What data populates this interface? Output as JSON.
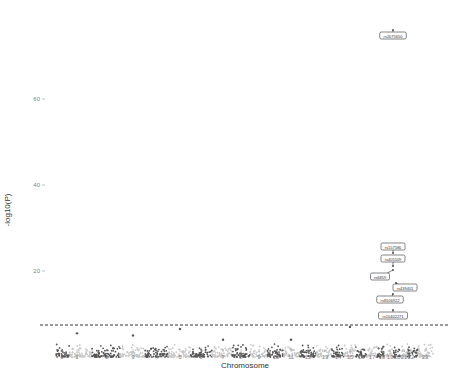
{
  "chart_data": {
    "type": "scatter",
    "subtype": "manhattan",
    "title": "",
    "xlabel": "Chromosome",
    "ylabel": "-log10(P)",
    "ylim": [
      0,
      80
    ],
    "yticks": [
      20,
      40,
      60
    ],
    "grid": false,
    "legend": null,
    "significance_threshold": 7.3,
    "threshold_style": "dashed",
    "point_color": "#555555",
    "chromosomes": [
      {
        "label": "0",
        "x": 62
      },
      {
        "label": "1",
        "x": 77
      },
      {
        "label": "2",
        "x": 107
      },
      {
        "label": "3",
        "x": 133
      },
      {
        "label": "4",
        "x": 157
      },
      {
        "label": "5",
        "x": 180
      },
      {
        "label": "6",
        "x": 201
      },
      {
        "label": "7",
        "x": 223
      },
      {
        "label": "8",
        "x": 241
      },
      {
        "label": "9",
        "x": 259
      },
      {
        "label": "10",
        "x": 276
      },
      {
        "label": "11",
        "x": 291
      },
      {
        "label": "12",
        "x": 308
      },
      {
        "label": "13",
        "x": 325
      },
      {
        "label": "14",
        "x": 338
      },
      {
        "label": "15",
        "x": 350
      },
      {
        "label": "16",
        "x": 361
      },
      {
        "label": "17",
        "x": 372
      },
      {
        "label": "18",
        "x": 382
      },
      {
        "label": "19",
        "x": 390
      },
      {
        "label": "20",
        "x": 397
      },
      {
        "label": "21",
        "x": 404
      },
      {
        "label": "22",
        "x": 411
      },
      {
        "label": "23",
        "x": 425
      }
    ],
    "annotated_snps": [
      {
        "id": "rs2075650",
        "chromosome": "19",
        "neglog10p": 76
      },
      {
        "id": "rs157580",
        "chromosome": "19",
        "neglog10p": 24
      },
      {
        "id": "rs405509",
        "chromosome": "19",
        "neglog10p": 22
      },
      {
        "id": "rs6859",
        "chromosome": "19",
        "neglog10p": 19
      },
      {
        "id": "rs439401",
        "chromosome": "19",
        "neglog10p": 17
      },
      {
        "id": "rs8106922",
        "chromosome": "19",
        "neglog10p": 14
      },
      {
        "id": "rs10402271",
        "chromosome": "19",
        "neglog10p": 10
      }
    ],
    "chrom_peaks": [
      {
        "chromosome": "1",
        "max": 5.5
      },
      {
        "chromosome": "3",
        "max": 5
      },
      {
        "chromosome": "5",
        "max": 6.5
      },
      {
        "chromosome": "7",
        "max": 4
      },
      {
        "chromosome": "11",
        "max": 4
      },
      {
        "chromosome": "15",
        "max": 7
      }
    ]
  },
  "axes": {
    "xlabel": "Chromosome",
    "ylabel": "-log10(P)",
    "yticks": [
      "60",
      "40",
      "20"
    ]
  }
}
